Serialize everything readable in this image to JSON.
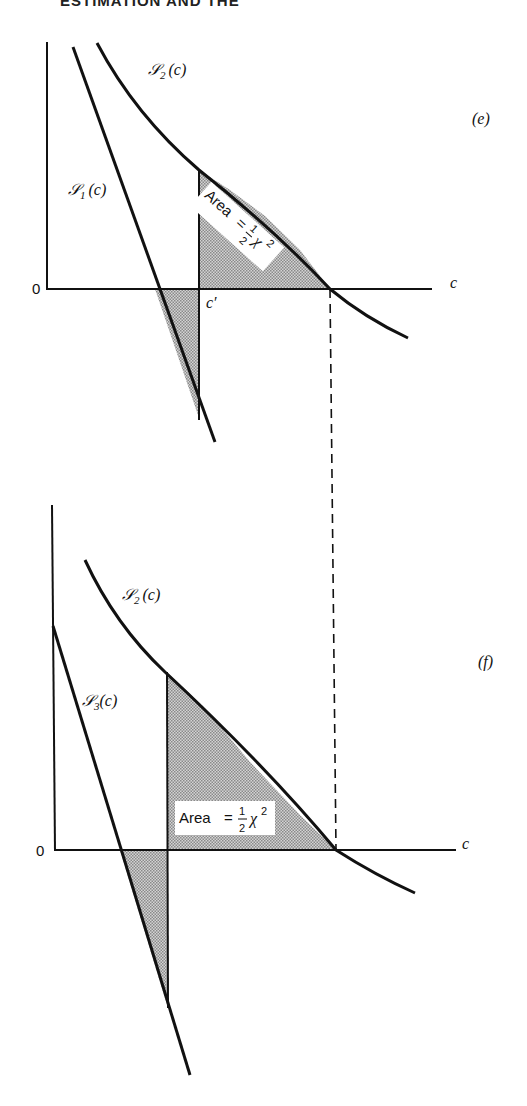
{
  "header": {
    "text": "ESTIMATION AND THE"
  },
  "panels": [
    {
      "id": "e",
      "panel_label": "(e)",
      "x_axis_label": "c",
      "origin_label": "0",
      "curves": [
        {
          "name": "S2",
          "label_main": "𝒮",
          "label_sub": "2",
          "label_arg": "(c)"
        },
        {
          "name": "S1",
          "label_main": "𝒮",
          "label_sub": "1",
          "label_arg": "(c)"
        }
      ],
      "vertical_marker_label": "c′",
      "area_label": {
        "prefix": "Area",
        "eq": "=",
        "num": "1",
        "den": "2",
        "chi": "χ",
        "exp": "2"
      }
    },
    {
      "id": "f",
      "panel_label": "(f)",
      "x_axis_label": "c",
      "origin_label": "0",
      "curves": [
        {
          "name": "S2",
          "label_main": "𝒮",
          "label_sub": "2",
          "label_arg": "(c)"
        },
        {
          "name": "S3",
          "label_main": "𝒮",
          "label_sub": "3",
          "label_arg": "(c)"
        }
      ],
      "area_label": {
        "prefix": "Area",
        "eq": "=",
        "num": "1",
        "den": "2",
        "chi": "χ",
        "exp": "2"
      }
    }
  ],
  "colors": {
    "ink": "#111111",
    "shade": "#b8b8b8",
    "background": "#ffffff"
  }
}
